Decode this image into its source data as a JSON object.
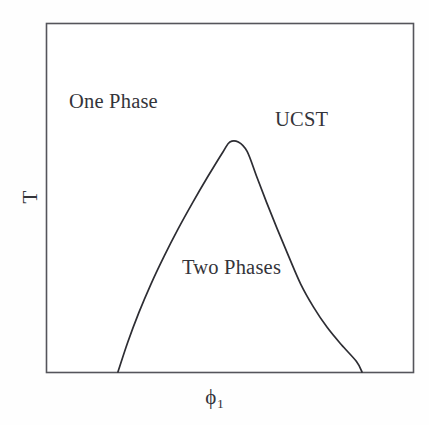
{
  "figure": {
    "kind": "phase-diagram",
    "background_color": "#fefefe",
    "frame_color": "#55555b",
    "curve_color": "#2d2d33",
    "text_color": "#34343a"
  },
  "axes": {
    "x_label_variable": "ϕ",
    "x_label_subscript": "1",
    "y_label": "T",
    "frame": {
      "left": 46,
      "top": 23,
      "right": 413,
      "bottom": 372
    },
    "ticks_shown": false,
    "gridlines_shown": false
  },
  "annotations": {
    "one_phase": "One Phase",
    "two_phases": "Two Phases",
    "ucst": "UCST"
  },
  "chart_data": {
    "type": "line",
    "title": "",
    "subtitle": "",
    "xlabel": "ϕ1",
    "ylabel": "T",
    "xlim": [
      0,
      1
    ],
    "ylim": [
      0,
      1
    ],
    "grid": false,
    "legend_position": "none",
    "axis_tick_labels": {
      "x": [],
      "y": []
    },
    "series": [
      {
        "name": "binodal (coexistence curve)",
        "color": "#2d2d33",
        "closed": false,
        "x": [
          0.196,
          0.223,
          0.253,
          0.286,
          0.322,
          0.36,
          0.4,
          0.441,
          0.483,
          0.501,
          0.524,
          0.548,
          0.574,
          0.601,
          0.63,
          0.661,
          0.694,
          0.729,
          0.766,
          0.805,
          0.846,
          0.861
        ],
        "y": [
          0.0,
          0.086,
          0.17,
          0.252,
          0.332,
          0.41,
          0.486,
          0.56,
          0.632,
          0.659,
          0.659,
          0.632,
          0.56,
          0.486,
          0.41,
          0.332,
          0.252,
          0.186,
          0.128,
          0.078,
          0.03,
          0.0
        ]
      }
    ],
    "critical_point": {
      "label": "UCST",
      "description": "upper critical solution temperature, apex of the binodal dome",
      "x": 0.512,
      "y": 0.659
    },
    "regions": [
      {
        "label": "One Phase",
        "description": "single homogeneous phase, above the binodal"
      },
      {
        "label": "Two Phases",
        "description": "two coexisting phases, inside the binodal dome"
      }
    ],
    "annotations": [
      {
        "text": "One Phase",
        "x": 0.1,
        "y": 0.78
      },
      {
        "text": "UCST",
        "x": 0.66,
        "y": 0.73
      },
      {
        "text": "Two Phases",
        "x": 0.47,
        "y": 0.31
      }
    ]
  }
}
